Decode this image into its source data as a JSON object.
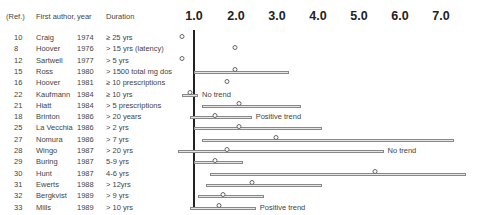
{
  "header": {
    "ref": "(Ref.)",
    "author": "First author,",
    "year": "year",
    "duration": "Duration"
  },
  "axis": {
    "ticks": [
      "1.0",
      "2.0",
      "3.0",
      "4.0",
      "5.0",
      "6.0",
      "7.0"
    ]
  },
  "rows": [
    {
      "ref": "10",
      "author": "Craig",
      "year": "1974",
      "duration": "≥ 25 yrs",
      "note": ""
    },
    {
      "ref": "8",
      "author": "Hoover",
      "year": "1976",
      "duration": "> 15 yrs (latency)",
      "note": ""
    },
    {
      "ref": "12",
      "author": "Sartwell",
      "year": "1977",
      "duration": "> 5 yrs",
      "note": ""
    },
    {
      "ref": "15",
      "author": "Ross",
      "year": "1980",
      "duration": "> 1500 total mg dos",
      "note": ""
    },
    {
      "ref": "16",
      "author": "Hoover",
      "year": "1981",
      "duration": "≥ 10 prescriptions",
      "note": ""
    },
    {
      "ref": "22",
      "author": "Kaufmann",
      "year": "1984",
      "duration": "≥ 10 yrs",
      "note": "No trend"
    },
    {
      "ref": "21",
      "author": "Hiatt",
      "year": "1984",
      "duration": "> 5 prescriptions",
      "note": ""
    },
    {
      "ref": "18",
      "author": "Brinton",
      "year": "1986",
      "duration": "> 20 years",
      "note": "Positive trend"
    },
    {
      "ref": "25",
      "author": "La Vecchia",
      "year": "1986",
      "duration": "> 2 yrs",
      "note": ""
    },
    {
      "ref": "27",
      "author": "Nomura",
      "year": "1986",
      "duration": "> 7 yrs",
      "note": ""
    },
    {
      "ref": "28",
      "author": "Wingo",
      "year": "1987",
      "duration": "> 20 yrs",
      "note": "No trend"
    },
    {
      "ref": "29",
      "author": "Buring",
      "year": "1987",
      "duration": "5-9 yrs",
      "note": ""
    },
    {
      "ref": "30",
      "author": "Hunt",
      "year": "1987",
      "duration": "4-6 yrs",
      "note": ""
    },
    {
      "ref": "31",
      "author": "Ewerts",
      "year": "1988",
      "duration": "> 12yrs",
      "note": ""
    },
    {
      "ref": "32",
      "author": "Bergkvist",
      "year": "1989",
      "duration": "> 9 yrs",
      "note": ""
    },
    {
      "ref": "33",
      "author": "Mills",
      "year": "1989",
      "duration": "> 10 yrs",
      "note": "Positive trend"
    }
  ],
  "chart_data": {
    "type": "forest",
    "title": "",
    "xlabel": "Relative risk",
    "xlim": [
      0.7,
      7.5
    ],
    "x_ticks": [
      1.0,
      2.0,
      3.0,
      4.0,
      5.0,
      6.0,
      7.0
    ],
    "reference_line": 1.0,
    "columns": [
      "(Ref.)",
      "First author, year",
      "Duration"
    ],
    "studies": [
      {
        "ref": 10,
        "author": "Craig",
        "year": 1974,
        "duration": "≥ 25 yrs",
        "estimate": 0.7,
        "ci": null,
        "note": ""
      },
      {
        "ref": 8,
        "author": "Hoover",
        "year": 1976,
        "duration": "> 15 yrs (latency)",
        "estimate": 2.0,
        "ci": null,
        "note": ""
      },
      {
        "ref": 12,
        "author": "Sartwell",
        "year": "1977",
        "duration": "> 5 yrs",
        "estimate": 0.7,
        "ci": null,
        "note": ""
      },
      {
        "ref": 15,
        "author": "Ross",
        "year": 1980,
        "duration": "> 1500 total mg dos",
        "estimate": 2.0,
        "ci": [
          1.0,
          3.3
        ],
        "note": ""
      },
      {
        "ref": 16,
        "author": "Hoover",
        "year": 1981,
        "duration": "≥ 10 prescriptions",
        "estimate": 1.8,
        "ci": null,
        "note": ""
      },
      {
        "ref": 22,
        "author": "Kaufmann",
        "year": 1984,
        "duration": "≥ 10 yrs",
        "estimate": 0.9,
        "ci": [
          0.7,
          1.1
        ],
        "note": "No trend"
      },
      {
        "ref": 21,
        "author": "Hiatt",
        "year": 1984,
        "duration": "> 5 prescriptions",
        "estimate": 2.1,
        "ci": [
          1.2,
          3.6
        ],
        "note": ""
      },
      {
        "ref": 18,
        "author": "Brinton",
        "year": 1986,
        "duration": "> 20 years",
        "estimate": 1.5,
        "ci": [
          0.9,
          2.4
        ],
        "note": "Positive trend"
      },
      {
        "ref": 25,
        "author": "La Vecchia",
        "year": "1986",
        "duration": "> 2 yrs",
        "estimate": 2.1,
        "ci": [
          1.0,
          4.1
        ],
        "note": ""
      },
      {
        "ref": 27,
        "author": "Nomura",
        "year": 1986,
        "duration": "> 7 yrs",
        "estimate": 3.0,
        "ci": [
          1.2,
          7.3
        ],
        "note": ""
      },
      {
        "ref": 28,
        "author": "Wingo",
        "year": 1987,
        "duration": "> 20 yrs",
        "estimate": 1.8,
        "ci": [
          0.6,
          5.6
        ],
        "note": "No trend"
      },
      {
        "ref": 29,
        "author": "Buring",
        "year": 1987,
        "duration": "5-9 yrs",
        "estimate": 1.5,
        "ci": [
          1.0,
          2.2
        ],
        "note": ""
      },
      {
        "ref": 30,
        "author": "Hunt",
        "year": 1987,
        "duration": "4-6 yrs",
        "estimate": 5.4,
        "ci": [
          1.4,
          7.6
        ],
        "note": ""
      },
      {
        "ref": 31,
        "author": "Ewerts",
        "year": 1988,
        "duration": "> 12yrs",
        "estimate": 2.4,
        "ci": [
          1.3,
          4.1
        ],
        "note": ""
      },
      {
        "ref": 32,
        "author": "Bergkvist",
        "year": 1989,
        "duration": "> 9 yrs",
        "estimate": 1.7,
        "ci": [
          1.1,
          2.7
        ],
        "note": ""
      },
      {
        "ref": 33,
        "author": "Mills",
        "year": 1989,
        "duration": "> 10 yrs",
        "estimate": 1.6,
        "ci": [
          0.9,
          2.5
        ],
        "note": "Positive trend"
      }
    ]
  }
}
